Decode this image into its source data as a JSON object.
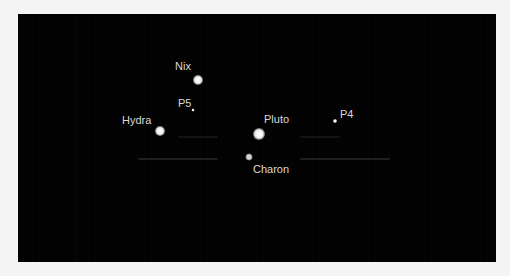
{
  "image": {
    "subject": "Pluto system moons",
    "background_color": "#020202",
    "page_color": "#f4f4f4"
  },
  "bodies": [
    {
      "name": "Nix",
      "label_x": 157,
      "label_y": 47,
      "dot_x": 180,
      "dot_y": 66,
      "size": 10
    },
    {
      "name": "P5",
      "label_x": 160,
      "label_y": 84,
      "dot_x": 175,
      "dot_y": 96,
      "size": 3
    },
    {
      "name": "Hydra",
      "label_x": 104,
      "label_y": 101,
      "dot_x": 142,
      "dot_y": 117,
      "size": 10
    },
    {
      "name": "Pluto",
      "label_x": 246,
      "label_y": 100,
      "dot_x": 241,
      "dot_y": 120,
      "size": 12
    },
    {
      "name": "Charon",
      "label_x": 235,
      "label_y": 150,
      "dot_x": 231,
      "dot_y": 143,
      "size": 7
    },
    {
      "name": "P4",
      "label_x": 322,
      "label_y": 95,
      "dot_x": 317,
      "dot_y": 107,
      "size": 4
    }
  ]
}
